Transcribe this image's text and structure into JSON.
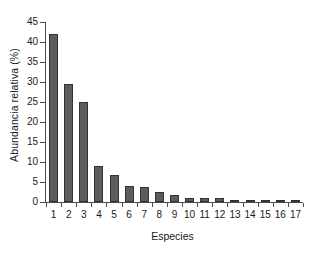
{
  "chart_data": {
    "type": "bar",
    "title": "",
    "xlabel": "Especies",
    "ylabel": "Abundancia relativa (%)",
    "categories": [
      "1",
      "2",
      "3",
      "4",
      "5",
      "6",
      "7",
      "8",
      "9",
      "10",
      "11",
      "12",
      "13",
      "14",
      "15",
      "16",
      "17"
    ],
    "values": [
      42.0,
      29.5,
      25.0,
      9.0,
      6.8,
      4.1,
      3.8,
      2.4,
      1.8,
      1.1,
      1.1,
      1.1,
      0.4,
      0.2,
      0.2,
      0.2,
      0.2
    ],
    "ylim": [
      0,
      45
    ],
    "yticks": [
      0,
      5,
      10,
      15,
      20,
      25,
      30,
      35,
      40,
      45
    ],
    "ytick_labels": [
      "0",
      "5",
      "10",
      "15",
      "20",
      "25",
      "30",
      "35",
      "40",
      "45"
    ],
    "grid": false,
    "legend": null,
    "bar_color": "#5c5c5c",
    "bar_edge_color": "#333333",
    "axis_color": "#4d4d4d",
    "background": "#ffffff"
  }
}
